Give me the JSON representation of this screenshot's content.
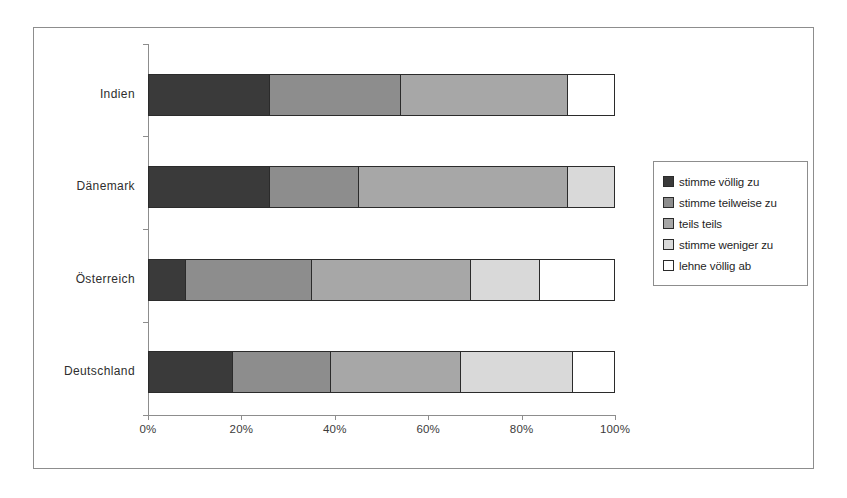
{
  "chart_data": {
    "type": "bar",
    "orientation": "horizontal",
    "stacked": true,
    "normalized": true,
    "title": "",
    "subtitle": "",
    "xlabel": "",
    "ylabel": "",
    "xlim": [
      0,
      100
    ],
    "xticks": [
      0,
      20,
      40,
      60,
      80,
      100
    ],
    "xticklabels": [
      "0%",
      "20%",
      "40%",
      "60%",
      "80%",
      "100%"
    ],
    "grid": false,
    "legend_position": "right",
    "categories": [
      "Indien",
      "Dänemark",
      "Österreich",
      "Deutschland"
    ],
    "series": [
      {
        "name": "stimme völlig zu",
        "color": "#3a3a3a",
        "values": [
          26,
          26,
          8,
          18
        ]
      },
      {
        "name": "stimme teilweise zu",
        "color": "#8d8d8d",
        "values": [
          28,
          19,
          27,
          21
        ]
      },
      {
        "name": "teils teils",
        "color": "#a7a7a7",
        "values": [
          36,
          45,
          34,
          28
        ]
      },
      {
        "name": "stimme weniger zu",
        "color": "#d9d9d9",
        "values": [
          0,
          10,
          15,
          24
        ]
      },
      {
        "name": "lehne völlig ab",
        "color": "#ffffff",
        "values": [
          10,
          0,
          16,
          9
        ]
      }
    ]
  },
  "axis": {
    "x_tick_labels": [
      "0%",
      "20%",
      "40%",
      "60%",
      "80%",
      "100%"
    ],
    "category_labels": [
      "Indien",
      "Dänemark",
      "Österreich",
      "Deutschland"
    ]
  },
  "legend": {
    "items": [
      {
        "label": "stimme völlig zu",
        "color": "#3a3a3a"
      },
      {
        "label": "stimme teilweise zu",
        "color": "#8d8d8d"
      },
      {
        "label": "teils teils",
        "color": "#a7a7a7"
      },
      {
        "label": "stimme weniger zu",
        "color": "#d9d9d9"
      },
      {
        "label": "lehne völlig ab",
        "color": "#ffffff"
      }
    ]
  }
}
